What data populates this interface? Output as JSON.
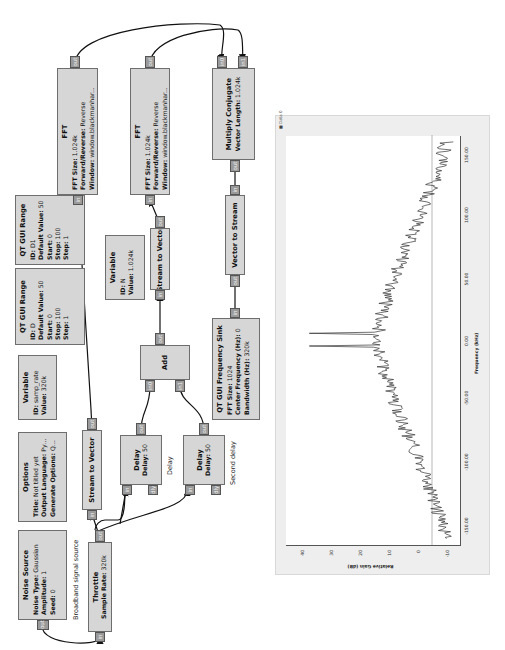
{
  "flowgraph": {
    "blocks": {
      "noise_source": {
        "title": "Noise Source",
        "params": [
          {
            "k": "Noise Type:",
            "v": "Gaussian"
          },
          {
            "k": "Amplitude:",
            "v": "1"
          },
          {
            "k": "Seed:",
            "v": "0"
          }
        ],
        "ports": {
          "out": "out"
        }
      },
      "options": {
        "title": "Options",
        "params": [
          {
            "k": "Title:",
            "v": "Not titled yet"
          },
          {
            "k": "Output Language:",
            "v": "Python"
          },
          {
            "k": "Generate Options:",
            "v": "QT GUI"
          }
        ]
      },
      "var_samp_rate": {
        "title": "Variable",
        "params": [
          {
            "k": "ID:",
            "v": "samp_rate"
          },
          {
            "k": "Value:",
            "v": "320k"
          }
        ]
      },
      "range_d": {
        "title": "QT GUI Range",
        "params": [
          {
            "k": "ID:",
            "v": "D"
          },
          {
            "k": "Default Value:",
            "v": "50"
          },
          {
            "k": "Start:",
            "v": "0"
          },
          {
            "k": "Stop:",
            "v": "100"
          },
          {
            "k": "Step:",
            "v": "1"
          }
        ]
      },
      "range_d1": {
        "title": "QT GUI Range",
        "params": [
          {
            "k": "ID:",
            "v": "D1"
          },
          {
            "k": "Default Value:",
            "v": "50"
          },
          {
            "k": "Start:",
            "v": "0"
          },
          {
            "k": "Stop:",
            "v": "100"
          },
          {
            "k": "Step:",
            "v": "1"
          }
        ]
      },
      "throttle": {
        "title": "Throttle",
        "params": [
          {
            "k": "Sample Rate:",
            "v": "320k"
          }
        ],
        "ports": {
          "in": "in",
          "out": "out"
        }
      },
      "stream_to_vector_1": {
        "title": "Stream to Vector",
        "ports": {
          "in": "in",
          "out": "out"
        }
      },
      "fft_1": {
        "title": "FFT",
        "params": [
          {
            "k": "FFT Size:",
            "v": "1.024k"
          },
          {
            "k": "Forward/Reverse:",
            "v": "Reverse"
          },
          {
            "k": "Window:",
            "v": "window.blackmanhar..."
          },
          {
            "k": "Shift:",
            "v": "Yes"
          },
          {
            "k": "Num. Threads:",
            "v": "1"
          }
        ],
        "ports": {
          "in": "in",
          "out": "out"
        }
      },
      "fft_2": {
        "title": "FFT",
        "params": [
          {
            "k": "FFT Size:",
            "v": "1.024k"
          },
          {
            "k": "Forward/Reverse:",
            "v": "Reverse"
          },
          {
            "k": "Window:",
            "v": "window.blackmanhar..."
          },
          {
            "k": "Shift:",
            "v": "Yes"
          },
          {
            "k": "Num. Threads:",
            "v": "1"
          }
        ],
        "ports": {
          "in": "in",
          "out": "out"
        }
      },
      "delay_1": {
        "title": "Delay",
        "params": [
          {
            "k": "Delay:",
            "v": "50"
          }
        ],
        "ports": {
          "in": "in",
          "dly": "dly",
          "out": "out"
        },
        "comment": "Delay"
      },
      "delay_2": {
        "title": "Delay",
        "params": [
          {
            "k": "Delay:",
            "v": "50"
          }
        ],
        "ports": {
          "in": "in",
          "dly": "dly",
          "out": "out"
        },
        "comment": "Second delay"
      },
      "add": {
        "title": "Add",
        "ports": {
          "in0": "in0",
          "in1": "in1",
          "out": "out"
        }
      },
      "var_n": {
        "title": "Variable",
        "params": [
          {
            "k": "ID:",
            "v": "N"
          },
          {
            "k": "Value:",
            "v": "1.024k"
          }
        ]
      },
      "stream_to_vector_2": {
        "title": "Stream to Vector",
        "ports": {
          "in": "in",
          "out": "out"
        }
      },
      "multiply_conjugate": {
        "title": "Multiply Conjugate",
        "params": [
          {
            "k": "Vector Length:",
            "v": "1.024k"
          }
        ],
        "ports": {
          "in0": "in0",
          "in1": "in1",
          "out": "out"
        }
      },
      "vector_to_stream": {
        "title": "Vector to Stream",
        "ports": {
          "in": "in",
          "out": "out"
        }
      },
      "freq_sink": {
        "title": "QT GUI Frequency Sink",
        "params": [
          {
            "k": "FFT Size:",
            "v": "1024"
          },
          {
            "k": "Center Frequency (Hz):",
            "v": "0"
          },
          {
            "k": "Bandwidth (Hz):",
            "v": "320k"
          }
        ],
        "ports": {
          "in": "in"
        }
      }
    },
    "comments": {
      "broadband": "Broadband signal source"
    }
  },
  "plot": {
    "legend": "Data 0",
    "xlabel": "Frequency (kHz)",
    "ylabel": "Relative Gain (dB)"
  },
  "chart_data": {
    "type": "line",
    "title": "",
    "xlabel": "Frequency (kHz)",
    "ylabel": "Relative Gain (dB)",
    "xlim": [
      -160,
      160
    ],
    "ylim": [
      -15,
      45
    ],
    "x_ticks": [
      "-150.00",
      "-100.00",
      "-50.00",
      "0.00",
      "50.00",
      "100.00",
      "150.00"
    ],
    "y_ticks": [
      "-10",
      "0",
      "10",
      "20",
      "30",
      "40"
    ],
    "grid": false,
    "legend_position": "top-left",
    "series": [
      {
        "name": "Data 0",
        "x": [
          -155,
          -140,
          -125,
          -110,
          -95,
          -80,
          -65,
          -50,
          -35,
          -20,
          -10,
          -5,
          0,
          5,
          10,
          20,
          35,
          50,
          65,
          80,
          95,
          110,
          125,
          140,
          155
        ],
        "values": [
          -10,
          -8,
          -6,
          -3,
          -1,
          2,
          5,
          8,
          10,
          12,
          13,
          37,
          13,
          37,
          13,
          12,
          10,
          8,
          5,
          2,
          -1,
          -3,
          -6,
          -8,
          -10
        ]
      }
    ],
    "annotations": [
      "Two narrow peaks near 0 kHz reaching ~37 dB",
      "Reference line at 0 dB"
    ]
  }
}
